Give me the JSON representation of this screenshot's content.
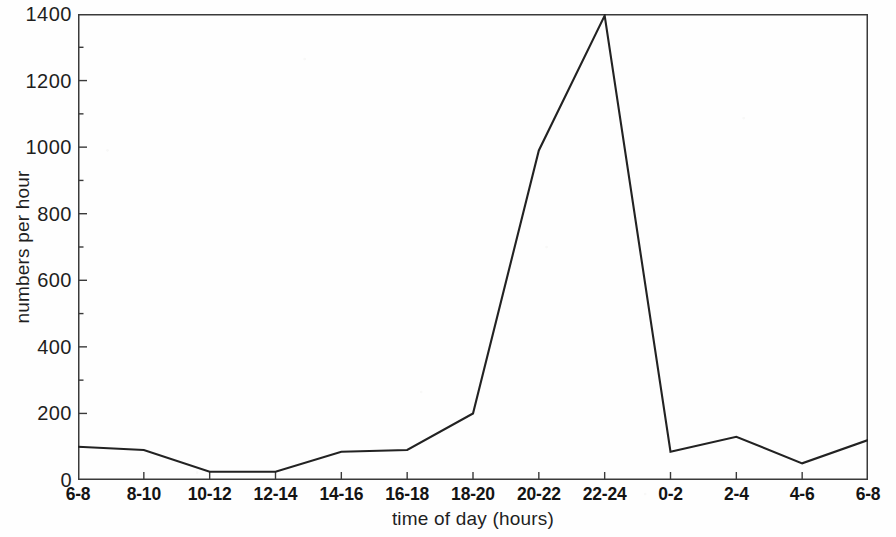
{
  "chart_data": {
    "type": "line",
    "title": "",
    "subtitle": "",
    "xlabel": "time of day (hours)",
    "ylabel": "numbers per hour",
    "categories": [
      "6-8",
      "8-10",
      "10-12",
      "12-14",
      "14-16",
      "16-18",
      "18-20",
      "20-22",
      "22-24",
      "0-2",
      "2-4",
      "4-6",
      "6-8"
    ],
    "values": [
      100,
      90,
      25,
      25,
      85,
      90,
      200,
      990,
      1395,
      85,
      130,
      50,
      120
    ],
    "series": [
      {
        "name": "numbers per hour",
        "values": [
          100,
          90,
          25,
          25,
          85,
          90,
          200,
          990,
          1395,
          85,
          130,
          50,
          120
        ]
      }
    ],
    "ylim": [
      0,
      1400
    ],
    "ytick_values": [
      0,
      200,
      400,
      600,
      800,
      1000,
      1200,
      1400
    ],
    "ytick_labels": [
      "0",
      "200",
      "400",
      "600",
      "800",
      "1000",
      "1200",
      "1400"
    ],
    "yminor_tick_step": 100,
    "grid": false,
    "legend": "none",
    "line_color": "#222222",
    "axis_color": "#3a3a3a",
    "frame": "full-box",
    "markers": false
  }
}
